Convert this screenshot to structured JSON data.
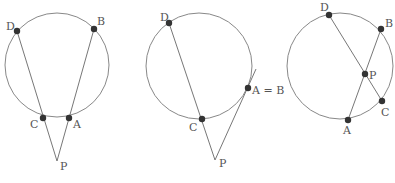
{
  "figure": {
    "colors": {
      "circle": "#888888",
      "line": "#777777",
      "point": "#333333",
      "label": "#555555"
    },
    "panels": [
      {
        "id": "external-secants",
        "circle": {
          "cx": 57,
          "cy": 65,
          "r": 52
        },
        "points": [
          {
            "name": "D",
            "x": 17,
            "y": 31,
            "lx": 6,
            "ly": 30
          },
          {
            "name": "B",
            "x": 94,
            "y": 29,
            "lx": 97,
            "ly": 25
          },
          {
            "name": "C",
            "x": 43,
            "y": 118,
            "lx": 30,
            "ly": 128
          },
          {
            "name": "A",
            "x": 69,
            "y": 118,
            "lx": 73,
            "ly": 128
          },
          {
            "name": "P",
            "x": 57,
            "y": 161,
            "lx": 60,
            "ly": 170,
            "dot": false
          }
        ],
        "segments": [
          [
            "D",
            "P"
          ],
          [
            "B",
            "P"
          ]
        ]
      },
      {
        "id": "secant-tangent",
        "circle": {
          "cx": 199,
          "cy": 66,
          "r": 53
        },
        "points": [
          {
            "name": "D",
            "x": 169,
            "y": 23,
            "lx": 160,
            "ly": 21
          },
          {
            "name": "C",
            "x": 202,
            "y": 119,
            "lx": 189,
            "ly": 131
          },
          {
            "name": "A = B",
            "x": 248,
            "y": 88,
            "lx": 252,
            "ly": 94
          },
          {
            "name": "P",
            "x": 215,
            "y": 160,
            "lx": 219,
            "ly": 167,
            "dot": false
          }
        ],
        "segments": [
          [
            "D",
            "P"
          ]
        ],
        "tangent": {
          "x1": 215,
          "y1": 160,
          "x2": 256,
          "y2": 69
        }
      },
      {
        "id": "intersecting-chords",
        "circle": {
          "cx": 340,
          "cy": 66,
          "r": 53
        },
        "points": [
          {
            "name": "D",
            "x": 329,
            "y": 15,
            "lx": 320,
            "ly": 11
          },
          {
            "name": "B",
            "x": 381,
            "y": 29,
            "lx": 385,
            "ly": 27
          },
          {
            "name": "P",
            "x": 365,
            "y": 74,
            "lx": 369,
            "ly": 79
          },
          {
            "name": "C",
            "x": 382,
            "y": 101,
            "lx": 381,
            "ly": 116
          },
          {
            "name": "A",
            "x": 348,
            "y": 120,
            "lx": 343,
            "ly": 134
          }
        ],
        "segments": [
          [
            "D",
            "C"
          ],
          [
            "B",
            "A"
          ]
        ]
      }
    ]
  }
}
